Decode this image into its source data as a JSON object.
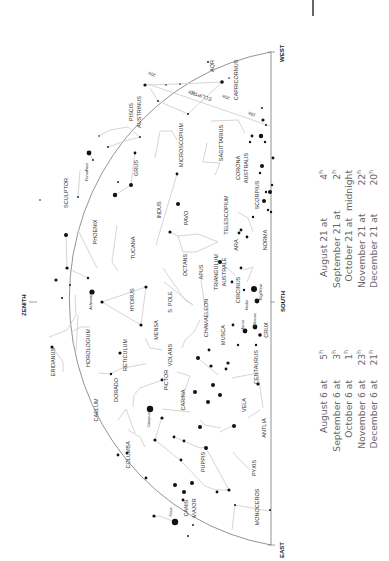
{
  "chart": {
    "directions": {
      "west": "WEST",
      "east": "EAST",
      "south": "SOUTH",
      "zenith": "ZENITH"
    },
    "ecliptic_label": "ECLIPTIC",
    "ecliptic_markers": [
      "20h",
      "21h",
      "20h",
      "19h"
    ],
    "constellations": [
      {
        "name": "AQR",
        "x": 214,
        "y": 66,
        "size": 5.5
      },
      {
        "name": "CAPRICORNUS",
        "x": 238,
        "y": 80,
        "size": 5.5
      },
      {
        "name": "PISCIS",
        "x": 133,
        "y": 112,
        "size": 5.5
      },
      {
        "name": "AUSTRINUS",
        "x": 141,
        "y": 112,
        "size": 5.5
      },
      {
        "name": "MICROSCOPIUM",
        "x": 183,
        "y": 145,
        "size": 5.5
      },
      {
        "name": "SAGITTARIUS",
        "x": 223,
        "y": 143,
        "size": 5.5
      },
      {
        "name": "CORONA",
        "x": 240,
        "y": 168,
        "size": 5.5
      },
      {
        "name": "AUSTRALIS",
        "x": 248,
        "y": 168,
        "size": 5.5
      },
      {
        "name": "GRUS",
        "x": 138,
        "y": 168,
        "size": 5.5
      },
      {
        "name": "SCULPTOR",
        "x": 68,
        "y": 193,
        "size": 5.5
      },
      {
        "name": "TELESCOPIUM",
        "x": 228,
        "y": 215,
        "size": 5.5
      },
      {
        "name": "SCORPIUS",
        "x": 259,
        "y": 195,
        "size": 5.5
      },
      {
        "name": "INDUS",
        "x": 161,
        "y": 210,
        "size": 5.5
      },
      {
        "name": "PAVO",
        "x": 188,
        "y": 218,
        "size": 5.5
      },
      {
        "name": "PHOENIX",
        "x": 97,
        "y": 232,
        "size": 5.5
      },
      {
        "name": "TUCANA",
        "x": 135,
        "y": 248,
        "size": 5.5
      },
      {
        "name": "ARA",
        "x": 238,
        "y": 245,
        "size": 5.5
      },
      {
        "name": "NORMA",
        "x": 267,
        "y": 240,
        "size": 5.5
      },
      {
        "name": "OCTANS",
        "x": 187,
        "y": 265,
        "size": 5.5
      },
      {
        "name": "APUS",
        "x": 203,
        "y": 272,
        "size": 5.5
      },
      {
        "name": "TRIANGULUM",
        "x": 218,
        "y": 272,
        "size": 5.5
      },
      {
        "name": "AUSTRALE",
        "x": 226,
        "y": 272,
        "size": 5.5
      },
      {
        "name": "HYDRUS",
        "x": 134,
        "y": 300,
        "size": 5.5
      },
      {
        "name": "S. POLE",
        "x": 172,
        "y": 302,
        "size": 5.5
      },
      {
        "name": "CIRCINUS",
        "x": 240,
        "y": 290,
        "size": 5.5
      },
      {
        "name": "CHAMAELEON",
        "x": 208,
        "y": 318,
        "size": 5.5
      },
      {
        "name": "MUSCA",
        "x": 225,
        "y": 335,
        "size": 5.5
      },
      {
        "name": "CRUX",
        "x": 268,
        "y": 330,
        "size": 5.5
      },
      {
        "name": "MENSA",
        "x": 158,
        "y": 330,
        "size": 5.5
      },
      {
        "name": "ERIDANUS",
        "x": 55,
        "y": 362,
        "size": 5.5
      },
      {
        "name": "HOROLOGIUM",
        "x": 90,
        "y": 348,
        "size": 5.5
      },
      {
        "name": "RETICULUM",
        "x": 127,
        "y": 355,
        "size": 5.5
      },
      {
        "name": "VOLANS",
        "x": 172,
        "y": 355,
        "size": 5.5
      },
      {
        "name": "CENTAURUS",
        "x": 258,
        "y": 367,
        "size": 5.5
      },
      {
        "name": "DORADO",
        "x": 118,
        "y": 390,
        "size": 5.5
      },
      {
        "name": "PICTOR",
        "x": 168,
        "y": 380,
        "size": 5.5
      },
      {
        "name": "CAELUM",
        "x": 98,
        "y": 410,
        "size": 5.5
      },
      {
        "name": "CARINA",
        "x": 185,
        "y": 400,
        "size": 5.5
      },
      {
        "name": "VELA",
        "x": 246,
        "y": 405,
        "size": 5.5
      },
      {
        "name": "ANTLIA",
        "x": 266,
        "y": 428,
        "size": 5.5
      },
      {
        "name": "COLUMBA",
        "x": 130,
        "y": 455,
        "size": 5.5
      },
      {
        "name": "PUPPIS",
        "x": 205,
        "y": 462,
        "size": 5.5
      },
      {
        "name": "PYXIS",
        "x": 256,
        "y": 468,
        "size": 5.5
      },
      {
        "name": "CANIS",
        "x": 188,
        "y": 508,
        "size": 5.5
      },
      {
        "name": "MAJOR",
        "x": 196,
        "y": 508,
        "size": 5.5
      },
      {
        "name": "MONOCEROS",
        "x": 259,
        "y": 507,
        "size": 5.5
      }
    ],
    "star_names": [
      {
        "name": "Fomalhaut",
        "x": 88,
        "y": 172
      },
      {
        "name": "Achernar",
        "x": 92,
        "y": 302
      },
      {
        "name": "Rigil Kent",
        "x": 262,
        "y": 292
      },
      {
        "name": "Hadar",
        "x": 248,
        "y": 305
      },
      {
        "name": "Mimosa",
        "x": 256,
        "y": 320
      },
      {
        "name": "Acrux",
        "x": 244,
        "y": 325
      },
      {
        "name": "Canopus",
        "x": 150,
        "y": 420
      },
      {
        "name": "Sirius",
        "x": 172,
        "y": 512
      }
    ]
  },
  "viewing_times": {
    "column_a": [
      {
        "date": "August 6 at",
        "time": "5",
        "unit": "h"
      },
      {
        "date": "September 6 at",
        "time": "3",
        "unit": "h"
      },
      {
        "date": "October 6 at",
        "time": "1",
        "unit": "h"
      },
      {
        "date": "November 6 at",
        "time": "23",
        "unit": "h"
      },
      {
        "date": "December 6 at",
        "time": "21",
        "unit": "h"
      }
    ],
    "column_b": [
      {
        "date": "August 21 at",
        "time": "4",
        "unit": "h"
      },
      {
        "date": "September 21 at",
        "time": "2",
        "unit": "h"
      },
      {
        "date": "October 21 at",
        "time": "midnight",
        "unit": ""
      },
      {
        "date": "November 21 at",
        "time": "22",
        "unit": "h"
      },
      {
        "date": "December 21 at",
        "time": "20",
        "unit": "h"
      }
    ]
  }
}
